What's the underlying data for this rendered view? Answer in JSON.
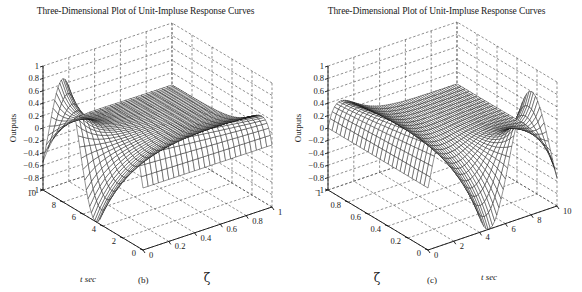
{
  "figure": {
    "panels": [
      {
        "id": "b",
        "title": "Three-Dimensional Plot of Unit-Impluse Response Curves",
        "caption": "(b)",
        "z_label": "Outputs",
        "t_label": "t sec",
        "zeta_label": "ζ",
        "z_ticks": [
          "1",
          "0.8",
          "0.6",
          "0.4",
          "0.2",
          "0",
          "−0.2",
          "−0.4",
          "−0.6",
          "−0.8",
          "−1"
        ],
        "t_ticks": [
          "10",
          "8",
          "6",
          "4",
          "2",
          "0"
        ],
        "zeta_ticks": [
          "0",
          "0.2",
          "0.4",
          "0.6",
          "0.8",
          "1"
        ]
      },
      {
        "id": "c",
        "title": "Three-Dimensional Plot of Unit-Impluse Response Curves",
        "caption": "(c)",
        "z_label": "Outputs",
        "t_label": "t sec",
        "zeta_label": "ζ",
        "z_ticks": [
          "1",
          "0.8",
          "0.6",
          "0.4",
          "0.2",
          "0",
          "−0.2",
          "−0.4",
          "−0.6",
          "−0.8",
          "−1"
        ],
        "t_ticks": [
          "0",
          "2",
          "4",
          "6",
          "8",
          "10"
        ],
        "zeta_ticks": [
          "1",
          "0.8",
          "0.6",
          "0.4",
          "0.2",
          "0"
        ]
      }
    ]
  },
  "chart_data": [
    {
      "type": "surface",
      "panel": "(b)",
      "title": "Three-Dimensional Plot of Unit-Impluse Response Curves",
      "function": "unit-impulse response y(t) = (1/sqrt(1-ζ^2)) e^{-ζt} sin(sqrt(1-ζ^2) t), ωn = 1",
      "x": {
        "label": "t sec",
        "range": [
          0,
          10
        ],
        "ticks": [
          0,
          2,
          4,
          6,
          8,
          10
        ]
      },
      "y": {
        "label": "ζ",
        "range": [
          0,
          1
        ],
        "ticks": [
          0,
          0.2,
          0.4,
          0.6,
          0.8,
          1
        ]
      },
      "z": {
        "label": "Outputs",
        "range": [
          -1,
          1
        ],
        "ticks": [
          -1,
          -0.8,
          -0.6,
          -0.4,
          -0.2,
          0,
          0.2,
          0.4,
          0.6,
          0.8,
          1
        ]
      },
      "zeta_values": [
        0,
        0.2,
        0.4,
        0.6,
        0.8,
        1.0
      ],
      "view": "azimuth looking from t=10,ζ=0 side toward origin; t axis on left, ζ axis on right",
      "grid": true
    },
    {
      "type": "surface",
      "panel": "(c)",
      "title": "Three-Dimensional Plot of Unit-Impluse Response Curves",
      "function": "unit-impulse response y(t) = (1/sqrt(1-ζ^2)) e^{-ζt} sin(sqrt(1-ζ^2) t), ωn = 1",
      "x": {
        "label": "t sec",
        "range": [
          0,
          10
        ],
        "ticks": [
          0,
          2,
          4,
          6,
          8,
          10
        ]
      },
      "y": {
        "label": "ζ",
        "range": [
          0,
          1
        ],
        "ticks": [
          0,
          0.2,
          0.4,
          0.6,
          0.8,
          1
        ]
      },
      "z": {
        "label": "Outputs",
        "range": [
          -1,
          1
        ],
        "ticks": [
          -1,
          -0.8,
          -0.6,
          -0.4,
          -0.2,
          0,
          0.2,
          0.4,
          0.6,
          0.8,
          1
        ]
      },
      "view": "mirrored view; ζ axis on left, t axis on right",
      "grid": true
    }
  ]
}
